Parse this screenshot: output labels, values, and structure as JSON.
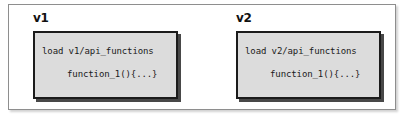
{
  "diagram": {
    "background_color": "#ffffff",
    "frame_border_color": "#8e8e8e",
    "box_fill_color": "#dcdcdc",
    "box_border_color": "#1b1b1b",
    "text_color": "#1a1a1a",
    "groups": [
      {
        "label": "v1",
        "code": {
          "line_1": "load v1/api_functions",
          "line_2": "function_1(){...}"
        }
      },
      {
        "label": "v2",
        "code": {
          "line_1": "load v2/api_functions",
          "line_2": "function_1(){...}"
        }
      }
    ]
  }
}
